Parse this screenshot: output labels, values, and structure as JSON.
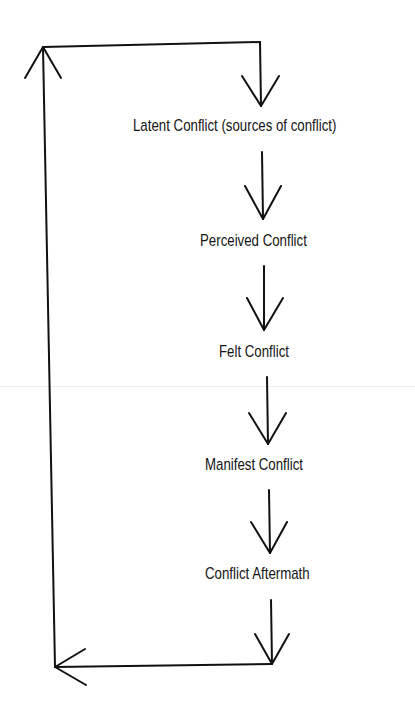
{
  "diagram": {
    "type": "cyclical-process-flow",
    "line_color": "#111111",
    "text_color": "#151515",
    "background": "#ffffff",
    "stages": [
      {
        "label": "Latent Conflict (sources of conflict)"
      },
      {
        "label": "Perceived Conflict"
      },
      {
        "label": "Felt Conflict"
      },
      {
        "label": "Manifest Conflict"
      },
      {
        "label": "Conflict Aftermath"
      }
    ],
    "flow": [
      "Latent Conflict (sources of conflict)",
      "Perceived Conflict",
      "Felt Conflict",
      "Manifest Conflict",
      "Conflict Aftermath",
      "Latent Conflict (sources of conflict)"
    ],
    "feedback_loop": "Conflict Aftermath returns to Latent Conflict via left-side loop"
  }
}
